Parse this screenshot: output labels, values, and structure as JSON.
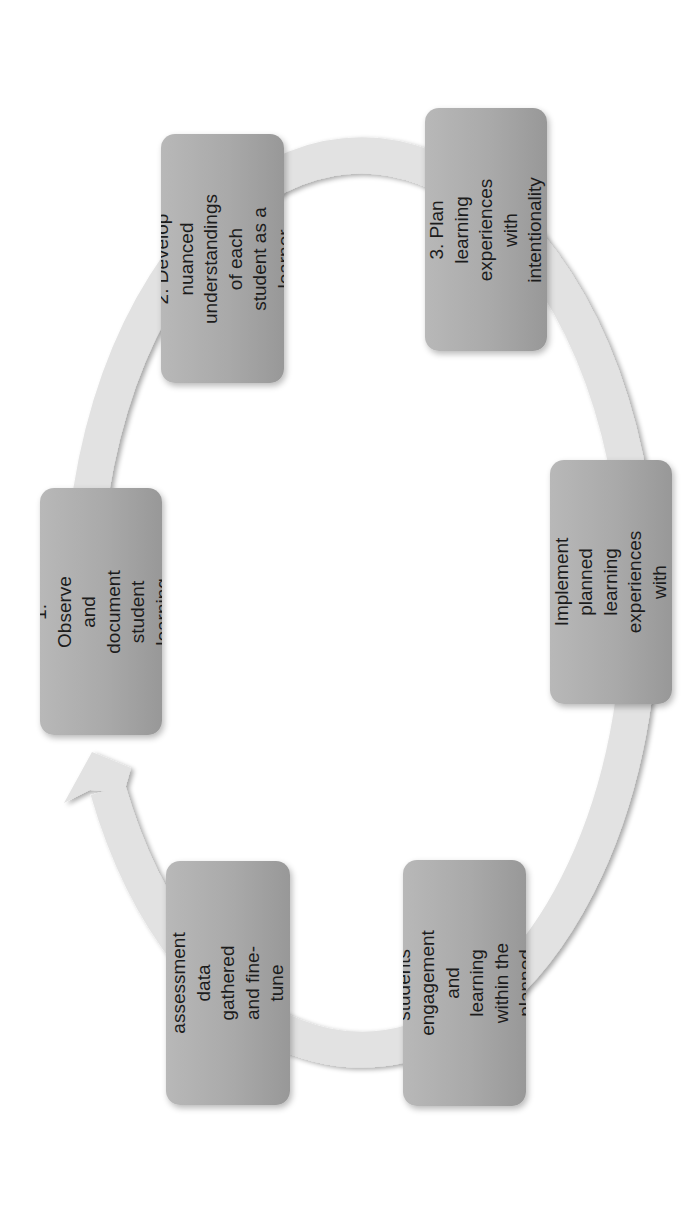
{
  "diagram": {
    "type": "cycle",
    "orientation": "rotated 90 degrees counterclockwise",
    "colors": {
      "background": "#ffffff",
      "box_fill_light": "#b8b8b8",
      "box_fill_dark": "#989898",
      "ring": "#e2e2e2",
      "text": "#1c1c1c"
    },
    "steps": [
      {
        "number": 1,
        "label": "1. Observe and\ndocument\nstudent learning"
      },
      {
        "number": 2,
        "label": "2. Develop nuanced\nunderstandings of each\nstudent as a learner"
      },
      {
        "number": 3,
        "label": "3. Plan learning\nexperiences with\nintentionality"
      },
      {
        "number": 4,
        "label": "4. Implement planned\nlearning experiences\nwith flexibility"
      },
      {
        "number": 5,
        "label": "5. Assess students'\nengagement and\nlearning within the\nplanned experiences"
      },
      {
        "number": 6,
        "label": "6. Reflect on the\nassessment data\ngathered and fine-tune\nfuture lessons"
      }
    ],
    "flow": "1 → 2 → 3 → 4 → 5 → 6 → 1 (arrow returns to step 1)"
  }
}
